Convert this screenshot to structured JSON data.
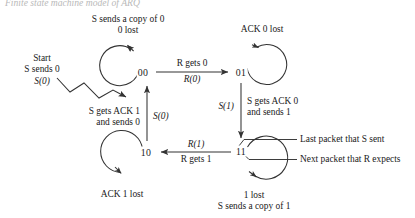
{
  "figure": {
    "title": "Finite state machine model of ARQ",
    "kind": "state-transition-diagram"
  },
  "states": [
    {
      "id": "s00",
      "label": "00",
      "x": 143,
      "y": 72
    },
    {
      "id": "s01",
      "label": "01",
      "x": 241,
      "y": 72
    },
    {
      "id": "s10",
      "label": "10",
      "x": 146,
      "y": 152
    },
    {
      "id": "s11",
      "label": "11",
      "x": 241,
      "y": 151
    }
  ],
  "self_loops": {
    "s00": {
      "line1": "S sends a copy of 0",
      "line2": "0 lost"
    },
    "s01": {
      "line1": "ACK 0 lost"
    },
    "s10": {
      "line1": "ACK 1 lost"
    },
    "s11": {
      "line1": "1 lost",
      "line2": "S sends a copy of 1"
    }
  },
  "start": {
    "line1": "Start",
    "line2": "S sends 0",
    "line3": "S(0)"
  },
  "transitions": [
    {
      "id": "t-00-to-01",
      "from": "00",
      "to": "01",
      "top_label": "R gets 0",
      "bottom_label": "R(0)",
      "direction": "right"
    },
    {
      "id": "t-01-to-11",
      "from": "01",
      "to": "11",
      "left_label": "S(1)",
      "right_line1": "S gets ACK 0",
      "right_line2": "and sends 1",
      "direction": "down"
    },
    {
      "id": "t-11-to-10",
      "from": "11",
      "to": "10",
      "top_label": "R(1)",
      "bottom_label": "R gets 1",
      "direction": "left"
    },
    {
      "id": "t-10-to-00",
      "from": "10",
      "to": "00",
      "right_label": "S(0)",
      "left_line1": "S gets ACK 1",
      "left_line2": "and sends 0",
      "direction": "up"
    }
  ],
  "callouts": [
    {
      "id": "callout-last-packet",
      "text": "Last packet that S sent",
      "points_to": "first digit of state 11"
    },
    {
      "id": "callout-next-packet",
      "text": "Next packet that R expects",
      "points_to": "second digit of state 11"
    }
  ],
  "style": {
    "stroke": "#333333",
    "text": "#1a1a1a",
    "background": "#ffffff"
  }
}
